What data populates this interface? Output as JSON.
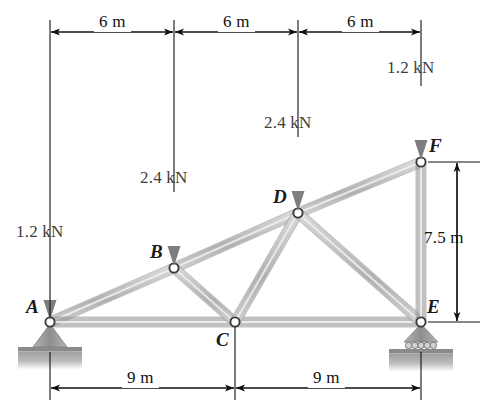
{
  "figure": {
    "units": "m",
    "colors": {
      "member": "#bcbcbc",
      "member_edge": "#8f8f8f",
      "arrow": "#8a8a8a",
      "dimension": "#111111",
      "ground": "#a8a8a8",
      "joint_fill": "#ffffff",
      "joint_stroke": "#3a3a3a"
    }
  },
  "joints": [
    {
      "id": "A",
      "label": "A",
      "x": 50,
      "y": 322,
      "label_x": 26,
      "label_y": 296,
      "support": "pin"
    },
    {
      "id": "B",
      "label": "B",
      "x": 174,
      "y": 268,
      "label_x": 150,
      "label_y": 241,
      "support": "none"
    },
    {
      "id": "C",
      "label": "C",
      "x": 235,
      "y": 322,
      "label_x": 216,
      "label_y": 329,
      "support": "none"
    },
    {
      "id": "D",
      "label": "D",
      "x": 298,
      "y": 213,
      "label_x": 273,
      "label_y": 186,
      "support": "none"
    },
    {
      "id": "E",
      "label": "E",
      "x": 421,
      "y": 322,
      "label_x": 427,
      "label_y": 296,
      "support": "roller"
    },
    {
      "id": "F",
      "label": "F",
      "x": 421,
      "y": 162,
      "label_x": 429,
      "label_y": 135,
      "support": "none"
    }
  ],
  "members": [
    {
      "from": "A",
      "to": "B"
    },
    {
      "from": "B",
      "to": "D"
    },
    {
      "from": "D",
      "to": "F"
    },
    {
      "from": "A",
      "to": "C"
    },
    {
      "from": "C",
      "to": "E"
    },
    {
      "from": "B",
      "to": "C"
    },
    {
      "from": "C",
      "to": "D"
    },
    {
      "from": "D",
      "to": "E"
    },
    {
      "from": "F",
      "to": "E"
    }
  ],
  "loads": [
    {
      "at": "A",
      "magnitude": "1.2",
      "unit": "kN",
      "text": "1.2 kN",
      "direction": "down",
      "x": 50,
      "tail_y": 246,
      "head_y": 320,
      "label_x": 16,
      "label_y": 222
    },
    {
      "at": "B",
      "magnitude": "2.4",
      "unit": "kN",
      "text": "2.4 kN",
      "direction": "down",
      "x": 174,
      "tail_y": 192,
      "head_y": 266,
      "label_x": 140,
      "label_y": 168
    },
    {
      "at": "D",
      "magnitude": "2.4",
      "unit": "kN",
      "text": "2.4 kN",
      "direction": "down",
      "x": 298,
      "tail_y": 137,
      "head_y": 211,
      "label_x": 264,
      "label_y": 113
    },
    {
      "at": "F",
      "magnitude": "1.2",
      "unit": "kN",
      "text": "1.2 kN",
      "direction": "down",
      "x": 421,
      "tail_y": 86,
      "head_y": 160,
      "label_x": 387,
      "label_y": 58
    }
  ],
  "dimensions": {
    "top": {
      "axis_y": 32,
      "segments": [
        {
          "text": "6 m",
          "x1": 50,
          "x2": 174,
          "label_x": 94,
          "label_y": 12
        },
        {
          "text": "6 m",
          "x1": 174,
          "x2": 298,
          "label_x": 218,
          "label_y": 12
        },
        {
          "text": "6 m",
          "x1": 298,
          "x2": 421,
          "label_x": 342,
          "label_y": 12
        }
      ],
      "extension_lines": [
        {
          "x": 50,
          "y1": 20,
          "y2": 318
        },
        {
          "x": 174,
          "y1": 20,
          "y2": 192
        },
        {
          "x": 298,
          "y1": 20,
          "y2": 137
        },
        {
          "x": 421,
          "y1": 20,
          "y2": 86
        }
      ]
    },
    "bottom": {
      "axis_y": 388,
      "segments": [
        {
          "text": "9 m",
          "x1": 50,
          "x2": 235,
          "label_x": 122,
          "label_y": 368
        },
        {
          "text": "9 m",
          "x1": 235,
          "x2": 421,
          "label_x": 308,
          "label_y": 368
        }
      ],
      "extension_lines": [
        {
          "x": 50,
          "y1": 352,
          "y2": 400
        },
        {
          "x": 235,
          "y1": 327,
          "y2": 400
        },
        {
          "x": 421,
          "y1": 352,
          "y2": 400
        }
      ]
    },
    "right": {
      "axis_x": 457,
      "text": "7.5 m",
      "y1": 162,
      "y2": 322,
      "label_x": 424,
      "label_y": 228,
      "extension_lines": [
        {
          "y": 162,
          "x1": 428,
          "x2": 480
        },
        {
          "y": 322,
          "x1": 428,
          "x2": 480
        }
      ]
    }
  }
}
